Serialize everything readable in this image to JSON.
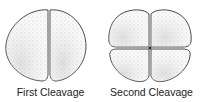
{
  "figures": [
    {
      "label": "First Cleavage",
      "cells": 2
    },
    {
      "label": "Second Cleavage",
      "cells": 4
    }
  ],
  "colors": {
    "outline": "#333333",
    "stipple": "#8a8a8a",
    "background": "#ffffff"
  }
}
